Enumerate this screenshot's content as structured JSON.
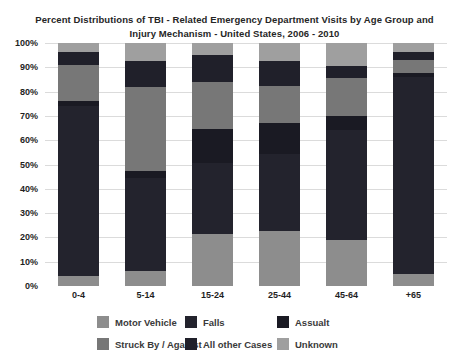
{
  "title": {
    "line1": "Percent Distributions of TBI - Related Emergency Department Visits by Age Group and",
    "line2": "Injury Mechanism - United States, 2006 - 2010"
  },
  "chart_data": {
    "type": "bar",
    "stacked": true,
    "title": "Percent Distributions of TBI - Related Emergency Department Visits by Age Group and Injury Mechanism - United States, 2006 - 2010",
    "categories": [
      "0-4",
      "5-14",
      "15-24",
      "25-44",
      "45-64",
      "+65"
    ],
    "stack_order_bottom_to_top": [
      "Motor Vehicle",
      "Falls",
      "Assualt",
      "Struck By / Against",
      "All other Cases",
      "Unknown"
    ],
    "series": [
      {
        "name": "Motor Vehicle",
        "color": "#8d8d8d",
        "values": [
          4,
          6,
          21.5,
          22.5,
          19,
          5
        ]
      },
      {
        "name": "Falls",
        "color": "#23232d",
        "values": [
          70,
          38.5,
          29,
          32,
          45,
          81
        ]
      },
      {
        "name": "Assualt",
        "color": "#1a1a23",
        "values": [
          2,
          3,
          14,
          12.5,
          6,
          1.5
        ]
      },
      {
        "name": "Struck By / Against",
        "color": "#777777",
        "values": [
          15,
          34.5,
          19.5,
          15.5,
          15.5,
          5.5
        ]
      },
      {
        "name": "All other Cases",
        "color": "#20202a",
        "values": [
          5.5,
          10.5,
          11,
          10,
          5,
          3.5
        ]
      },
      {
        "name": "Unknown",
        "color": "#9f9f9f",
        "values": [
          3.5,
          7.5,
          5,
          7.5,
          9.5,
          3.5
        ]
      }
    ],
    "y_axis": {
      "ticks": [
        "100%",
        "90%",
        "80%",
        "70%",
        "60%",
        "50%",
        "40%",
        "30%",
        "20%",
        "10%",
        "0%"
      ],
      "min": 0,
      "max": 100,
      "grid": true,
      "grid_color": "#dbdbdb"
    },
    "legend": {
      "position": "bottom",
      "rows": [
        [
          "Motor Vehicle",
          "Falls",
          "Assualt"
        ],
        [
          "Struck By / Against",
          "All other Cases",
          "Unknown"
        ]
      ]
    },
    "values_note": "percent, estimated from gridlines"
  }
}
